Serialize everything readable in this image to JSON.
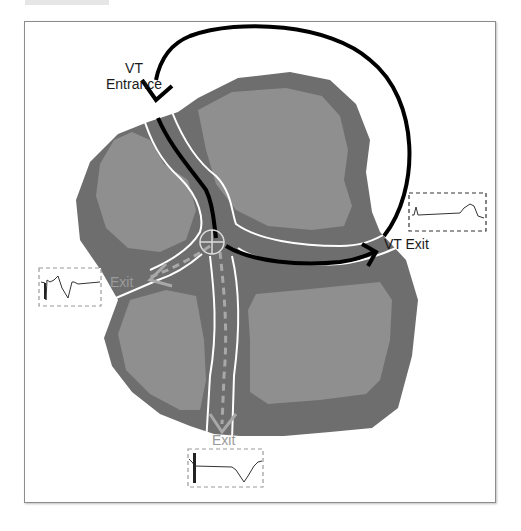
{
  "figure": {
    "type": "schematic of ventricular tachycardia reentry circuit through scar isthmus",
    "colors": {
      "scar_outer": "#6e6e6e",
      "scar_inner": "#8f8f8f",
      "channel_border": "#ffffff",
      "main_circuit_arrow": "#000000",
      "bystander_path": "#a8a8a8",
      "frame_border": "#8c8c8c"
    },
    "labels": {
      "entrance": [
        "VT",
        "Entrance"
      ],
      "vt_exit": "VT Exit",
      "exit_left": "Exit",
      "exit_bottom": "Exit"
    },
    "markers": {
      "crosshair": "ablation-target-crosshair"
    },
    "electrograms": [
      {
        "id": "egm-vt-exit",
        "description": "small early spike followed by flat baseline and late broad positive deflection"
      },
      {
        "id": "egm-left-exit",
        "description": "sharp spike with fractionated multiphasic signal"
      },
      {
        "id": "egm-bottom-exit",
        "description": "sharp spike followed by flat baseline and broad negative deflection"
      }
    ]
  }
}
